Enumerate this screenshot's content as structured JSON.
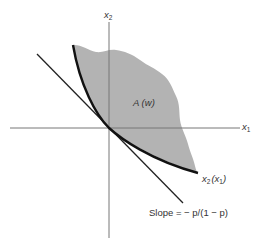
{
  "diagram": {
    "type": "economics-figure",
    "axes": {
      "y_axis": {
        "label": "x",
        "subscript": "2"
      },
      "x_axis": {
        "label": "x",
        "subscript": "1"
      }
    },
    "region": {
      "label": "A (w)",
      "fill_color": "#b3b3b3"
    },
    "curve": {
      "label_main": "x",
      "label_sub": "2",
      "label_paren_open": "(x",
      "label_paren_sub": "1",
      "label_paren_close": ")",
      "color": "#111111"
    },
    "tangent_line": {
      "label": "Slope = − p/(1 − p)",
      "color": "#222222"
    },
    "axis_color": "#777777"
  }
}
